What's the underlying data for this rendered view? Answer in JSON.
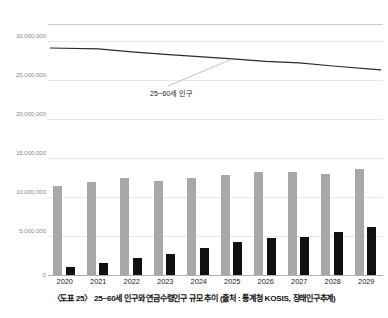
{
  "chart_data": {
    "type": "bar",
    "title": "",
    "xlabel": "",
    "ylabel": "",
    "categories": [
      "2020",
      "2021",
      "2022",
      "2023",
      "2024",
      "2025",
      "2026",
      "2027",
      "2028",
      "2029"
    ],
    "ylim": [
      0,
      30000000
    ],
    "ytick_labels": [
      "0",
      "5,000,000",
      "10,000,000",
      "15,000,000",
      "20,000,000",
      "25,000,000",
      "30,000,000"
    ],
    "ytick_values": [
      0,
      5000000,
      10000000,
      15000000,
      20000000,
      25000000,
      30000000
    ],
    "grid": true,
    "legend_position": "none",
    "series": [
      {
        "name": "연금수령 대상 규모 (회색 막대)",
        "type": "bar",
        "color": "#a8a8a8",
        "values": [
          11400000,
          11900000,
          12400000,
          12000000,
          12500000,
          12800000,
          13200000,
          13200000,
          13000000,
          13600000
        ]
      },
      {
        "name": "연금수령인구 (검정 막대)",
        "type": "bar",
        "color": "#111111",
        "values": [
          1000000,
          1500000,
          2200000,
          2700000,
          3500000,
          4200000,
          4700000,
          4900000,
          5500000,
          6200000
        ]
      },
      {
        "name": "25~60세 인구",
        "type": "line",
        "color": "#2b2b2b",
        "values": [
          29100000,
          29000000,
          28600000,
          28300000,
          28000000,
          27700000,
          27400000,
          27200000,
          26800000,
          26300000
        ]
      }
    ],
    "annotations": [
      {
        "text": "25~60세 인구",
        "target_category": "2025"
      }
    ]
  },
  "caption": {
    "text": "〈도표 25〉 25~60세 인구와 연금수령인구 규모 추이 (출처 : 통계청 KOSIS, 장래인구추계)"
  },
  "colors": {
    "bar_gray": "#a8a8a8",
    "bar_black": "#111111",
    "line": "#2b2b2b",
    "gridline": "#e9e9e9",
    "axis": "#b0b0b0",
    "tick_text": "#8d8d8d"
  }
}
